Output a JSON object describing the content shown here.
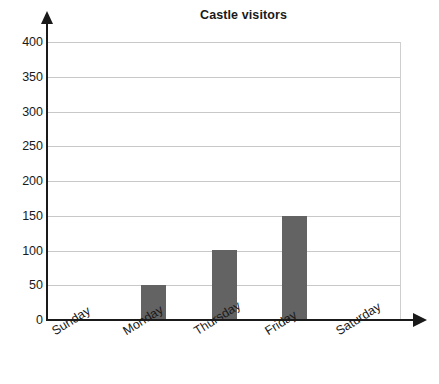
{
  "chart_data": {
    "type": "bar",
    "title": "Castle visitors",
    "xlabel": "",
    "ylabel": "",
    "categories": [
      "Sunday",
      "Monday",
      "Thursday",
      "Friday",
      "Saturday"
    ],
    "values": [
      0,
      50,
      100,
      150,
      0
    ],
    "ylim": [
      0,
      400
    ],
    "ytick_labels": [
      "400",
      "350",
      "300",
      "250",
      "200",
      "150",
      "100",
      "50",
      "0"
    ],
    "ytick_values": [
      400,
      350,
      300,
      250,
      200,
      150,
      100,
      50,
      0
    ],
    "grid": true,
    "legend": null,
    "series": [
      {
        "name": "Visitors",
        "values": [
          0,
          50,
          100,
          150,
          0
        ]
      }
    ],
    "colors": {
      "bar_fill": "#636363",
      "gridline": "#c8c8c8",
      "axis": "#1a1a1a",
      "background": "#ffffff",
      "plot_border": "#cfcfcf"
    }
  }
}
